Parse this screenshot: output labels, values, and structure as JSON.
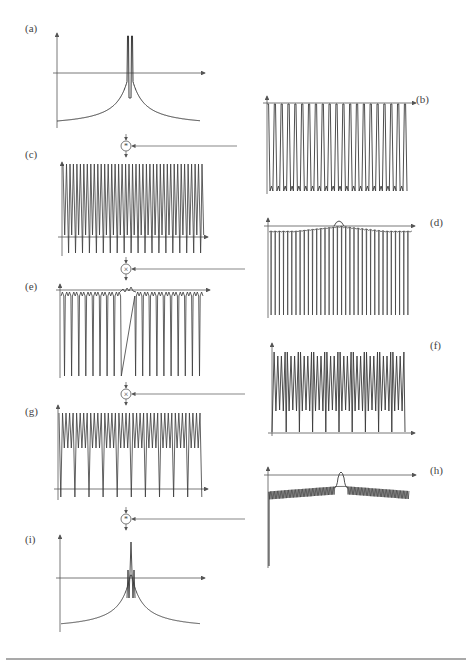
{
  "figure": {
    "panels": [
      {
        "id": "a",
        "label": "(a)",
        "description": "Central double-peaked spectrum with decaying tails"
      },
      {
        "id": "b",
        "label": "(b)",
        "description": "Periodic comb of downward spikes"
      },
      {
        "id": "c",
        "label": "(c)",
        "description": "Dense periodic comb (sum result)"
      },
      {
        "id": "d",
        "label": "(d)",
        "description": "Comb with central bump"
      },
      {
        "id": "e",
        "label": "(e)",
        "description": "Product result with central ripple"
      },
      {
        "id": "f",
        "label": "(f)",
        "description": "Periodic double-peaked comb"
      },
      {
        "id": "g",
        "label": "(g)",
        "description": "Product result with periodic deep dips"
      },
      {
        "id": "h",
        "label": "(h)",
        "description": "Small-tick comb with central bump and deep spike at origin"
      },
      {
        "id": "i",
        "label": "(i)",
        "description": "Central multi-peak spectrum with decaying tails"
      }
    ],
    "operators": [
      {
        "id": "op1",
        "symbol": "⊛",
        "name": "convolution",
        "between": [
          "a",
          "c"
        ],
        "input_from": "b"
      },
      {
        "id": "op2",
        "symbol": "⊗",
        "name": "multiplication",
        "between": [
          "c",
          "e"
        ],
        "input_from": "d"
      },
      {
        "id": "op3",
        "symbol": "⊗",
        "name": "multiplication",
        "between": [
          "e",
          "g"
        ],
        "input_from": "f"
      },
      {
        "id": "op4",
        "symbol": "⊛",
        "name": "convolution",
        "between": [
          "g",
          "i"
        ],
        "input_from": "h"
      }
    ]
  },
  "labels": {
    "a": "(a)",
    "b": "(b)",
    "c": "(c)",
    "d": "(d)",
    "e": "(e)",
    "f": "(f)",
    "g": "(g)",
    "h": "(h)",
    "i": "(i)"
  },
  "colors": {
    "line": "#3a3a3a",
    "axis": "#555555",
    "label": "#444444",
    "background": "#ffffff"
  }
}
